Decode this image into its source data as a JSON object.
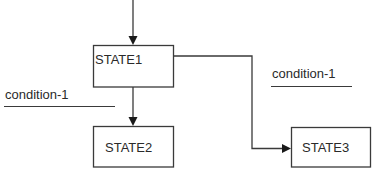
{
  "diagram": {
    "type": "state-transition",
    "colors": {
      "stroke": "#3a3a3a",
      "text": "#2a2a2a",
      "background": "#ffffff"
    },
    "states": [
      {
        "id": "state1",
        "label": "STATE1"
      },
      {
        "id": "state2",
        "label": "STATE2"
      },
      {
        "id": "state3",
        "label": "STATE3"
      }
    ],
    "transitions": [
      {
        "from": "entry",
        "to": "STATE1",
        "label": ""
      },
      {
        "from": "STATE1",
        "to": "STATE2",
        "label": "condition-1"
      },
      {
        "from": "STATE1",
        "to": "STATE3",
        "label": "condition-1"
      }
    ],
    "conditions": {
      "left": "condition-1",
      "right": "condition-1"
    }
  }
}
